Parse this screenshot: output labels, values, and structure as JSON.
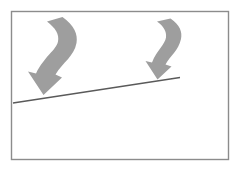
{
  "figure": {
    "title": "Two curved downward arrows over a rising trend line",
    "type": "schematic-diagram",
    "canvas": {
      "width": 240,
      "height": 173,
      "background_color": "#ffffff"
    },
    "frame": {
      "name": "outer border rectangle",
      "x": 11.5,
      "y": 11.5,
      "width": 217,
      "height": 148,
      "stroke_color": "#8c8c8c",
      "stroke_width": 1.4,
      "fill": "none"
    },
    "trend_line": {
      "label": "rising baseline",
      "x1": 13,
      "y1": 103,
      "x2": 180,
      "y2": 77.5,
      "stroke_color": "#5a5a5a",
      "stroke_width": 1.3,
      "direction": "upward to the right"
    },
    "arrows": [
      {
        "id": "left-arrow",
        "label": "left curved down arrow",
        "fill_color": "#9e9e9e",
        "tail_x": 72,
        "tail_y": 18,
        "tip_x": 44,
        "tip_y": 95,
        "path": "M 62.5,17.0 C 74.5,25.5 78.0,34.5 76.5,43.0 C 74.0,56.5 63.0,62.0 55.5,74.5 L 62.0,77.5 L 43.5,95.0 L 28.0,71.5 L 36.0,73.5 C 44.5,56.0 56.0,50.5 58.0,41.5 C 59.5,34.5 55.5,28.0 47.0,21.5 Z",
        "direction": "curves from upper right down to lower left, pointing down"
      },
      {
        "id": "right-arrow",
        "label": "right curved down arrow",
        "fill_color": "#9e9e9e",
        "tail_x": 178,
        "tail_y": 20,
        "tip_x": 158,
        "tip_y": 79,
        "path": "M 170.5,18.5 C 180.0,25.0 182.5,32.0 181.0,39.0 C 178.5,50.5 170.0,56.0 165.5,64.5 L 171.5,66.5 L 157.5,79.5 L 145.5,61.0 L 152.0,62.5 C 157.0,50.0 165.0,44.5 166.0,37.5 C 166.8,31.5 163.5,26.0 157.0,21.5 Z",
        "direction": "curves from upper right down to lower left, pointing down"
      }
    ]
  }
}
